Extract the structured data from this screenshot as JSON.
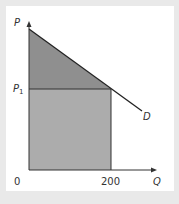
{
  "diagram": {
    "axis_y_label": "P",
    "axis_x_label": "Q",
    "origin_label": "0",
    "price_label": "P",
    "price_label_sub": "1",
    "quantity_label": "200",
    "curve_label": "D",
    "colors": {
      "upper_triangle": "#8f8f8f",
      "lower_rectangle": "#aaaaaa",
      "background": "#e9e9e9",
      "panel": "#ffffff",
      "line": "#222222"
    }
  }
}
